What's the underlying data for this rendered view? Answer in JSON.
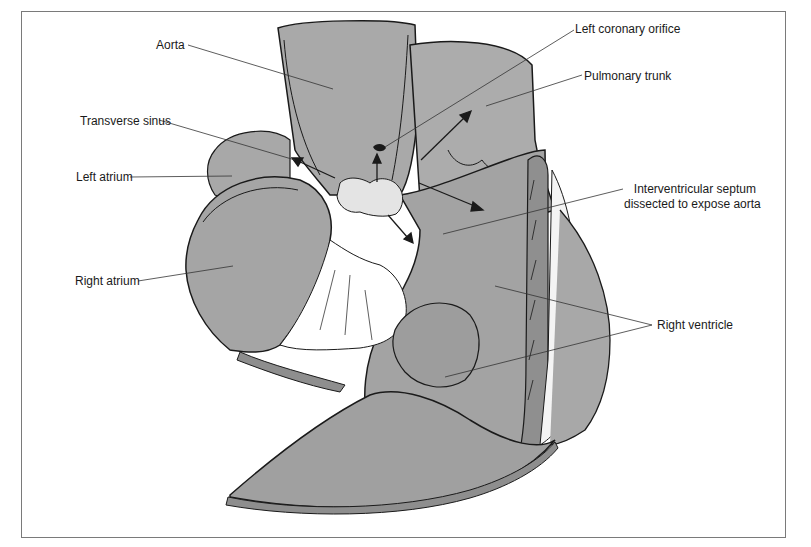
{
  "diagram": {
    "type": "anatomical-illustration",
    "colors": {
      "tissue_fill": "#a6a6a6",
      "tissue_light": "#bdbdbd",
      "outline": "#1a1a1a",
      "leader_line": "#333333",
      "frame": "#7a7a7a",
      "background": "#ffffff"
    },
    "labels": [
      {
        "id": "aorta",
        "text": "Aorta"
      },
      {
        "id": "transverse_sinus",
        "text": "Transverse sinus"
      },
      {
        "id": "left_atrium",
        "text": "Left atrium"
      },
      {
        "id": "right_atrium",
        "text": "Right atrium"
      },
      {
        "id": "left_coronary_orifice",
        "text": "Left coronary orifice"
      },
      {
        "id": "pulmonary_trunk",
        "text": "Pulmonary trunk"
      },
      {
        "id": "interventricular_septum_line1",
        "text": "Interventricular septum"
      },
      {
        "id": "interventricular_septum_line2",
        "text": "dissected to expose aorta"
      },
      {
        "id": "right_ventricle",
        "text": "Right ventricle"
      }
    ]
  }
}
